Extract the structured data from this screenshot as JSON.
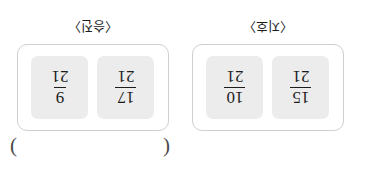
{
  "page": {
    "orientation_note": "upside-down",
    "blank": {
      "open_paren": "(",
      "close_paren": ")",
      "value": ""
    }
  },
  "groups": [
    {
      "label": "〈지호〉",
      "tiles": [
        {
          "numerator": "15",
          "denominator": "21"
        },
        {
          "numerator": "10",
          "denominator": "21"
        }
      ]
    },
    {
      "label": "〈승진〉",
      "tiles": [
        {
          "numerator": "17",
          "denominator": "21"
        },
        {
          "numerator": "9",
          "denominator": "21"
        }
      ]
    }
  ]
}
